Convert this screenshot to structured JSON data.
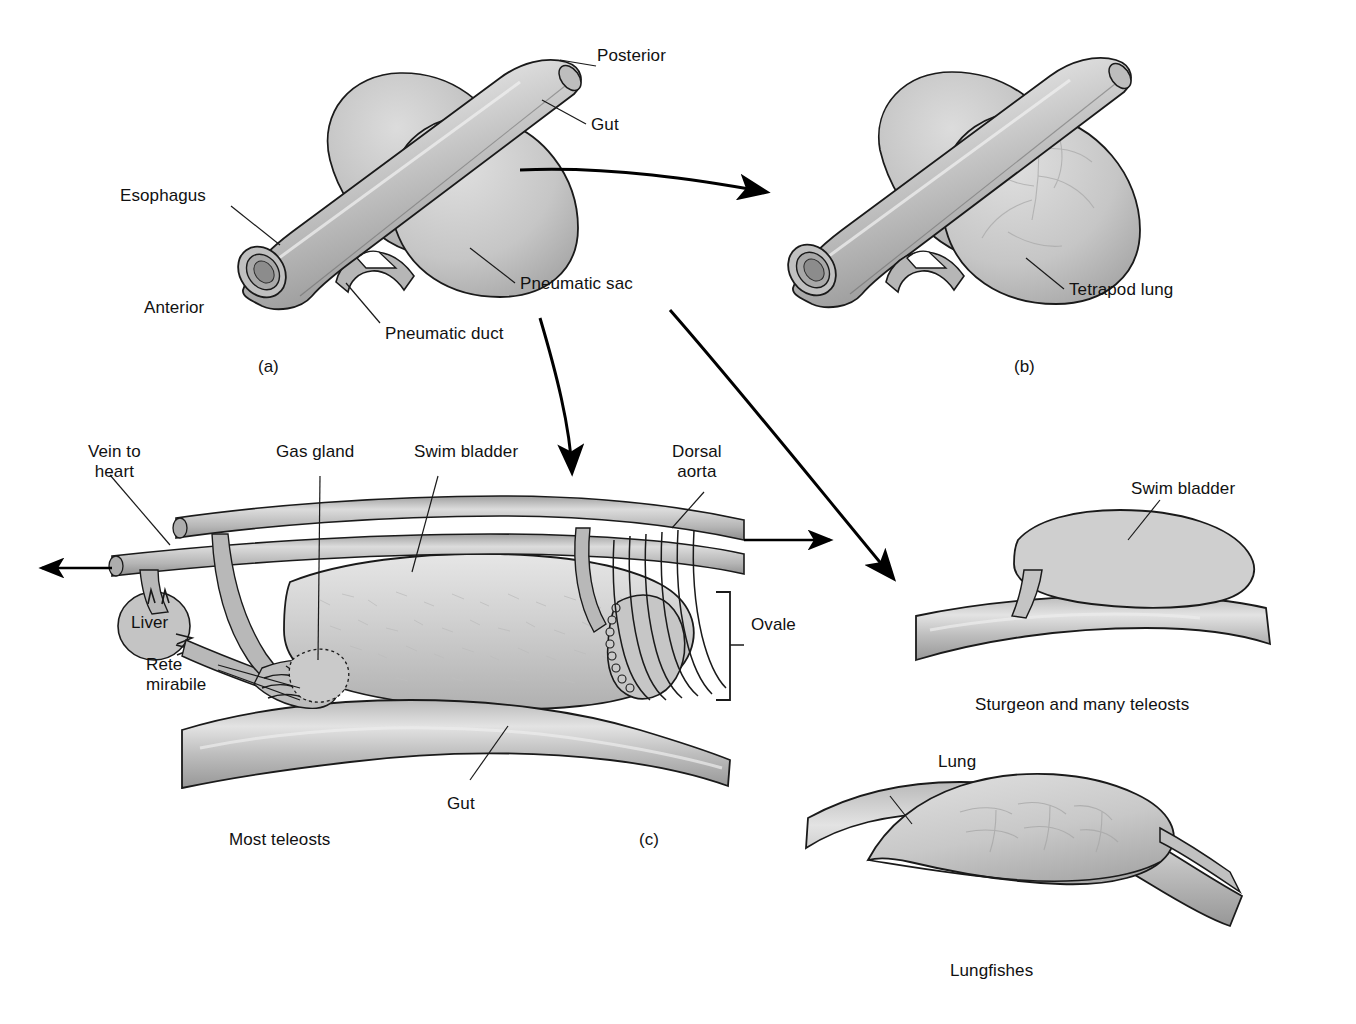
{
  "figure": {
    "title_visible": false,
    "panels": [
      {
        "id": "a",
        "caption": "(a)",
        "subtitle": ""
      },
      {
        "id": "b",
        "caption": "(b)",
        "subtitle": ""
      },
      {
        "id": "c",
        "caption": "(c)",
        "subtitle": "Most teleosts"
      }
    ]
  },
  "panel_a": {
    "id_label": "(a)",
    "labels": {
      "posterior": "Posterior",
      "gut": "Gut",
      "esophagus": "Esophagus",
      "anterior": "Anterior",
      "pneumatic_sac": "Pneumatic sac",
      "pneumatic_duct": "Pneumatic duct"
    }
  },
  "panel_b": {
    "id_label": "(b)",
    "labels": {
      "tetrapod_lung": "Tetrapod lung"
    }
  },
  "panel_c": {
    "id_label": "(c)",
    "subtitle": "Most teleosts",
    "labels": {
      "vein_to_heart": "Vein to\nheart",
      "gas_gland": "Gas gland",
      "swim_bladder": "Swim bladder",
      "dorsal_aorta": "Dorsal\naorta",
      "liver": "Liver",
      "rete_mirabile": "Rete\nmirabile",
      "ovale": "Ovale",
      "gut": "Gut"
    }
  },
  "panel_sturgeon": {
    "caption": "Sturgeon and many teleosts",
    "labels": {
      "swim_bladder": "Swim bladder"
    }
  },
  "panel_lungfish": {
    "caption": "Lungfishes",
    "labels": {
      "lung": "Lung"
    }
  },
  "colors": {
    "background": "#ffffff",
    "outline": "#1a1a1a",
    "tissue_light": "#d7d7d7",
    "tissue_mid": "#b4b4b4",
    "tissue_dark": "#8e8e8e",
    "text": "#111111",
    "arrow": "#000000"
  },
  "icons": {
    "arrow_to_b": "curved-arrow-icon",
    "arrow_to_c": "curved-arrow-down-icon",
    "arrow_to_sturgeon": "curved-arrow-diagonal-icon",
    "flow_left": "arrow-left-icon",
    "flow_right": "arrow-right-icon",
    "ovale_bracket": "bracket-icon"
  }
}
